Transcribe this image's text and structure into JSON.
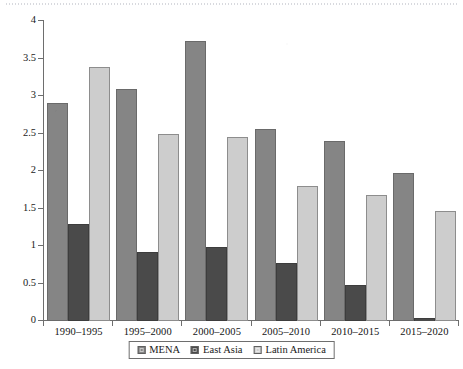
{
  "chart_data": {
    "type": "bar",
    "title": "",
    "xlabel": "",
    "ylabel": "",
    "ylim": [
      0,
      4
    ],
    "ytick_values": [
      0,
      0.5,
      1,
      1.5,
      2,
      2.5,
      3,
      3.5,
      4
    ],
    "ytick_labels": [
      "0",
      "0.5",
      "1",
      "1.5",
      "2",
      "2.5",
      "3",
      "3.5",
      "4"
    ],
    "grid": false,
    "legend_position": "bottom-center",
    "categories": [
      "1990–1995",
      "1995–2000",
      "2000–2005",
      "2005–2010",
      "2010–2015",
      "2015–2020"
    ],
    "series": [
      {
        "name": "MENA",
        "color": "#858585",
        "values": [
          2.91,
          3.09,
          3.74,
          2.56,
          2.4,
          1.97
        ]
      },
      {
        "name": "East Asia",
        "color": "#4a4a4a",
        "values": [
          1.3,
          0.92,
          0.99,
          0.77,
          0.48,
          0.04
        ]
      },
      {
        "name": "Latin America",
        "color": "#cdcdcd",
        "values": [
          3.39,
          2.49,
          2.45,
          1.8,
          1.68,
          1.47
        ]
      }
    ]
  }
}
